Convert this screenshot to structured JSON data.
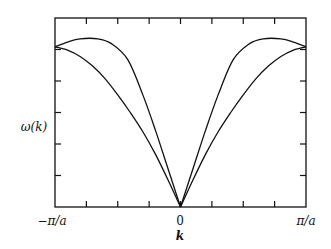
{
  "chart_data": {
    "type": "line",
    "title": "",
    "xlabel": "k",
    "ylabel": "ω(k)",
    "x_ticks": {
      "labels": [
        "−π/a",
        "0",
        "π/a"
      ],
      "positions": [
        -1,
        0,
        1
      ],
      "minor_count_between": 3
    },
    "y_ticks": {
      "labels": [],
      "count_interior": 4
    },
    "xlim": [
      -1,
      1
    ],
    "ylim": [
      0,
      1.18
    ],
    "x_units": "π/a",
    "grid": false,
    "legend": null,
    "series": [
      {
        "name": "upper branch",
        "x": [
          -1.0,
          -0.9,
          -0.8,
          -0.66,
          -0.55,
          -0.42,
          -0.3,
          -0.2,
          -0.1,
          0.0,
          0.1,
          0.2,
          0.3,
          0.42,
          0.55,
          0.66,
          0.8,
          0.9,
          1.0
        ],
        "y": [
          1.0,
          1.03,
          1.05,
          1.05,
          1.02,
          0.92,
          0.7,
          0.48,
          0.24,
          0.0,
          0.24,
          0.48,
          0.7,
          0.92,
          1.02,
          1.05,
          1.05,
          1.03,
          1.0
        ]
      },
      {
        "name": "lower branch",
        "x": [
          -1.0,
          -0.9,
          -0.8,
          -0.7,
          -0.6,
          -0.5,
          -0.4,
          -0.3,
          -0.2,
          -0.1,
          0.0,
          0.1,
          0.2,
          0.3,
          0.4,
          0.5,
          0.6,
          0.7,
          0.8,
          0.9,
          1.0
        ],
        "y": [
          1.0,
          0.98,
          0.94,
          0.88,
          0.8,
          0.7,
          0.59,
          0.47,
          0.33,
          0.17,
          0.0,
          0.17,
          0.33,
          0.47,
          0.59,
          0.7,
          0.8,
          0.88,
          0.94,
          0.98,
          1.0
        ]
      }
    ]
  },
  "labels": {
    "y_axis": "ω(k)",
    "x_axis": "k",
    "x_left": "−π/a",
    "x_center": "0",
    "x_right": "π/a"
  }
}
